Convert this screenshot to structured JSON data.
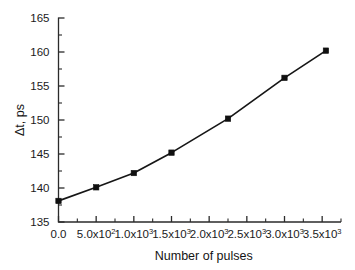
{
  "chart_data": {
    "type": "line",
    "title": "",
    "subtitle": "",
    "xlabel": "Number of pulses",
    "ylabel": "Δt, ps",
    "xlim": [
      0,
      3750
    ],
    "ylim": [
      135,
      165
    ],
    "grid": false,
    "legend": null,
    "marker": "square",
    "x": [
      0,
      500,
      1000,
      1500,
      2250,
      3000,
      3550
    ],
    "y": [
      138.1,
      140.1,
      142.2,
      145.2,
      150.2,
      156.2,
      160.2
    ],
    "series": [
      {
        "name": "Δt vs number of pulses",
        "x": [
          0,
          500,
          1000,
          1500,
          2250,
          3000,
          3550
        ],
        "values": [
          138.1,
          140.1,
          142.2,
          145.2,
          150.2,
          156.2,
          160.2
        ]
      }
    ],
    "y_ticks": [
      {
        "value": 135,
        "label": "135"
      },
      {
        "value": 140,
        "label": "140"
      },
      {
        "value": 145,
        "label": "145"
      },
      {
        "value": 150,
        "label": "150"
      },
      {
        "value": 155,
        "label": "155"
      },
      {
        "value": 160,
        "label": "160"
      },
      {
        "value": 165,
        "label": "165"
      }
    ],
    "y_minor_ticks": [
      137.5,
      142.5,
      147.5,
      152.5,
      157.5,
      162.5
    ],
    "x_ticks": [
      {
        "value": 0,
        "mantissa": "0.0",
        "base": "",
        "exponent": ""
      },
      {
        "value": 500,
        "mantissa": "5.0x10",
        "base": "",
        "exponent": "2"
      },
      {
        "value": 1000,
        "mantissa": "1.0x10",
        "base": "",
        "exponent": "3"
      },
      {
        "value": 1500,
        "mantissa": "1.5x10",
        "base": "",
        "exponent": "3"
      },
      {
        "value": 2000,
        "mantissa": "2.0x10",
        "base": "",
        "exponent": "3"
      },
      {
        "value": 2500,
        "mantissa": "2.5x10",
        "base": "",
        "exponent": "3"
      },
      {
        "value": 3000,
        "mantissa": "3.0x10",
        "base": "",
        "exponent": "3"
      },
      {
        "value": 3500,
        "mantissa": "3.5x10",
        "base": "",
        "exponent": "3"
      }
    ],
    "x_minor_ticks": [
      250,
      750,
      1250,
      1750,
      2250,
      2750,
      3250,
      3750
    ],
    "colors": {
      "line": "#161616",
      "marker": "#101010",
      "axis": "#2b2b2b",
      "text": "#1a1a1a",
      "background": "#ffffff"
    }
  }
}
